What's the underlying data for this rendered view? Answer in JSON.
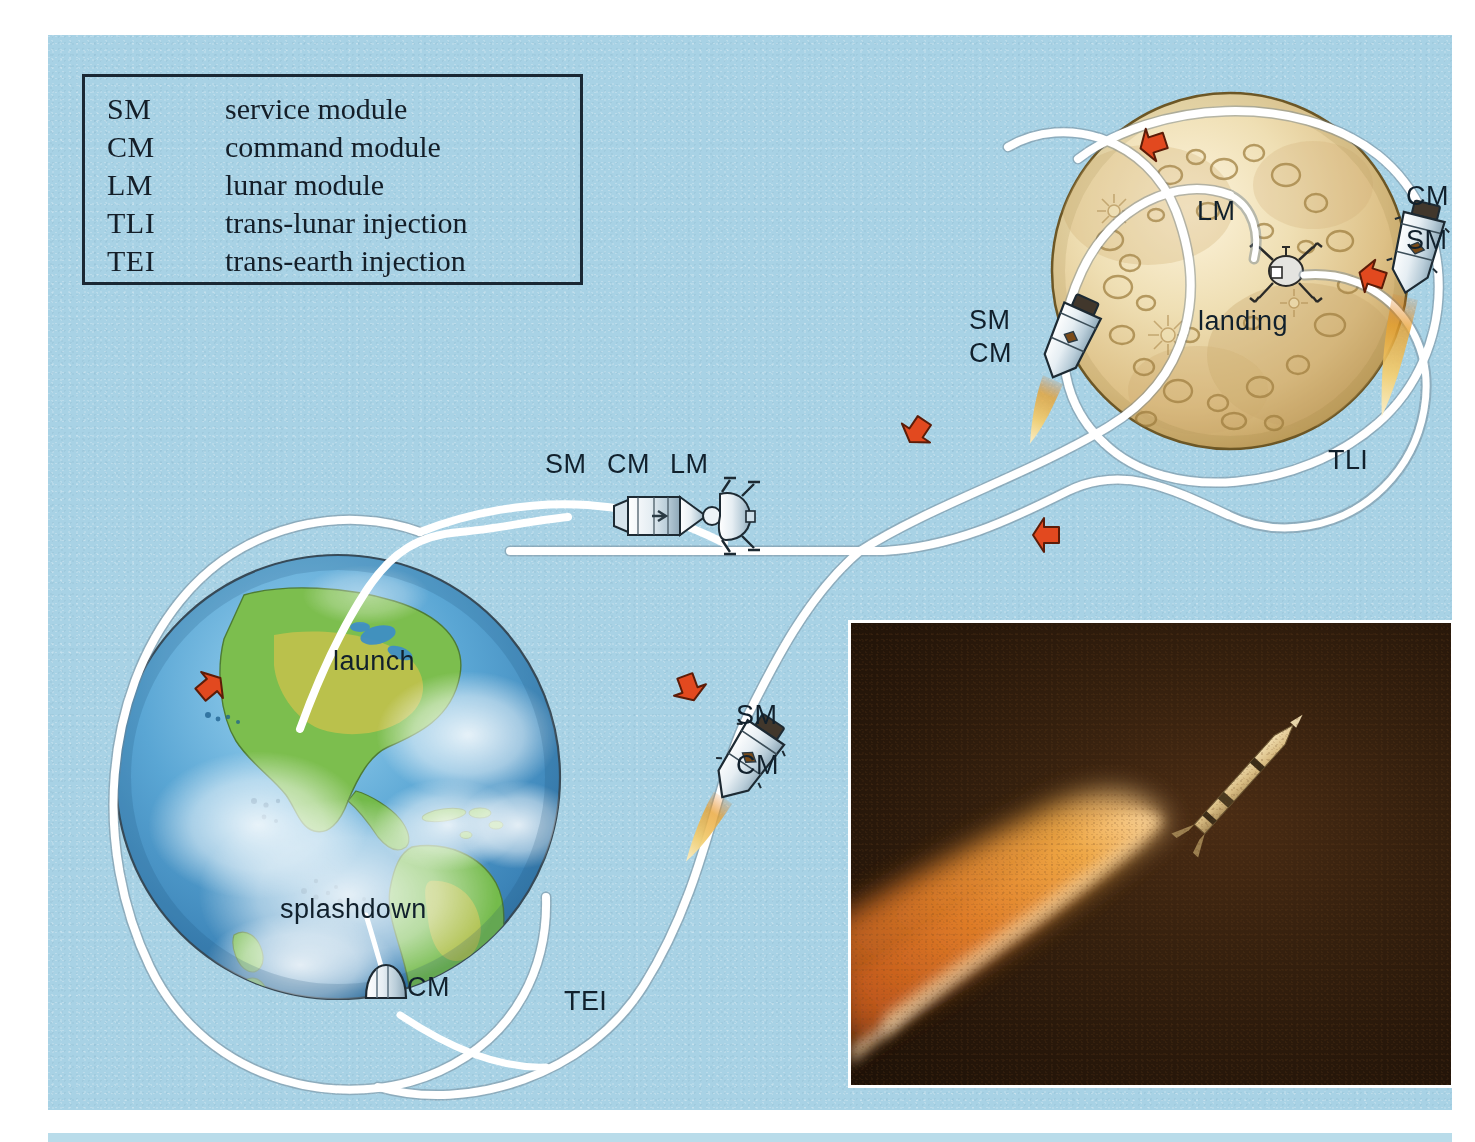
{
  "diagram": {
    "background_color": "#a8d2e5",
    "frame_color": "#ffffff"
  },
  "legend": {
    "border_color": "#1a2733",
    "entries": [
      {
        "abbr": "SM",
        "definition": "service module"
      },
      {
        "abbr": "CM",
        "definition": "command module"
      },
      {
        "abbr": "LM",
        "definition": "lunar module"
      },
      {
        "abbr": "TLI",
        "definition": "trans-lunar injection"
      },
      {
        "abbr": "TEI",
        "definition": "trans-earth injection"
      }
    ]
  },
  "labels": {
    "moon_lm": "LM",
    "moon_landing": "landing",
    "moon_cm": "CM",
    "moon_sm": "SM",
    "tli": "TLI",
    "lunar_orbit_sm": "SM",
    "lunar_orbit_cm": "CM",
    "cruise_sm": "SM",
    "cruise_cm": "CM",
    "cruise_lm": "LM",
    "tei_sm": "SM",
    "tei_cm": "CM",
    "earth_launch": "launch",
    "earth_splashdown": "splashdown",
    "earth_cm": "CM",
    "tei": "TEI"
  },
  "colors": {
    "trajectory": "#ffffff",
    "arrow": "#e2491f",
    "moon_light": "#f3e6c4",
    "moon_mid": "#d9bd80",
    "moon_dark": "#b99552",
    "earth_ocean": "#3f8fc4",
    "earth_land": "#6cb84a",
    "earth_land_dry": "#c8c24a",
    "earth_cloud": "#ffffff",
    "flame_outer": "#e08a22",
    "flame_inner": "#f7dd9a",
    "photo_background": "#2a1a0d",
    "photo_plume": "#e07a2a"
  },
  "photo_inset": {
    "subject": "saturn-v-launch-vehicle-in-flight",
    "background_color": "#2a1a0d",
    "plume_color": "#e07a2a"
  }
}
